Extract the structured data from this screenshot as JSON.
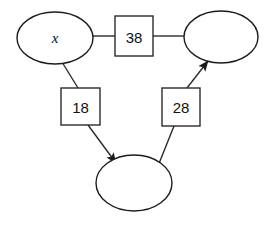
{
  "canvas": {
    "width": 272,
    "height": 231,
    "background": "#ffffff",
    "stroke_color": "#2b2b2b",
    "text_color": "#111111"
  },
  "diagram": {
    "type": "node-link-graph",
    "nodes": [
      {
        "id": "node-left",
        "shape": "ellipse",
        "label": "x",
        "label_style": "italic",
        "cx": 55,
        "cy": 38,
        "rx": 38,
        "ry": 26
      },
      {
        "id": "node-right",
        "shape": "ellipse",
        "label": "",
        "label_style": "normal",
        "cx": 221,
        "cy": 37,
        "rx": 37,
        "ry": 26
      },
      {
        "id": "node-bottom",
        "shape": "ellipse",
        "label": "",
        "label_style": "normal",
        "cx": 134,
        "cy": 183,
        "rx": 38,
        "ry": 28
      }
    ],
    "edge_boxes": [
      {
        "id": "box-top",
        "label": "38",
        "x": 115,
        "y": 16,
        "width": 38,
        "height": 40
      },
      {
        "id": "box-left",
        "label": "18",
        "x": 61,
        "y": 88,
        "width": 39,
        "height": 37
      },
      {
        "id": "box-right",
        "label": "28",
        "x": 162,
        "y": 88,
        "width": 38,
        "height": 38
      }
    ],
    "connectors": [
      {
        "id": "connector-left-to-box-top",
        "from": "node-left",
        "to": "box-top",
        "arrow": false,
        "x1": 93,
        "y1": 36,
        "x2": 115,
        "y2": 36
      },
      {
        "id": "connector-box-top-to-right",
        "from": "box-top",
        "to": "node-right",
        "arrow": false,
        "x1": 153,
        "y1": 36,
        "x2": 185,
        "y2": 36
      },
      {
        "id": "connector-left-to-box-left",
        "from": "node-left",
        "to": "box-left",
        "arrow": false,
        "x1": 62,
        "y1": 62,
        "x2": 78,
        "y2": 88
      },
      {
        "id": "connector-box-left-to-bottom",
        "from": "box-left",
        "to": "node-bottom",
        "arrow": true,
        "x1": 88,
        "y1": 125,
        "x2": 114,
        "y2": 161
      },
      {
        "id": "connector-bottom-to-box-right",
        "from": "node-bottom",
        "to": "box-right",
        "arrow": false,
        "x1": 158,
        "y1": 166,
        "x2": 174,
        "y2": 126
      },
      {
        "id": "connector-box-right-to-right",
        "from": "box-right",
        "to": "node-right",
        "arrow": true,
        "x1": 187,
        "y1": 88,
        "x2": 206,
        "y2": 63
      }
    ]
  }
}
